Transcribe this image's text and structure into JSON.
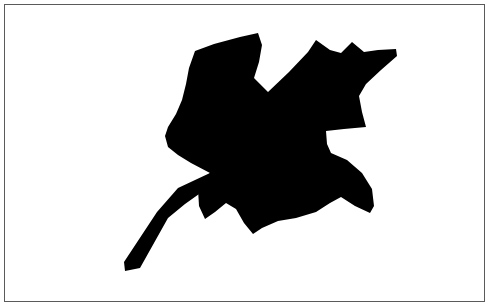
{
  "figure": {
    "canvas": {
      "width": 492,
      "height": 308,
      "background_color": "#ffffff"
    },
    "frame": {
      "name": "image-border",
      "left": 4,
      "top": 4,
      "width": 481,
      "height": 298,
      "border_width": 1,
      "border_color": "#5a5a5a",
      "fill_color": "#ffffff"
    },
    "shape": {
      "name": "maple-leaf-silhouette",
      "fill_color": "#000000",
      "description": "Solid black binary silhouette of a lobed maple-like leaf with a long slender petiole extending toward the lower left",
      "bounding_box": {
        "x": 124,
        "y": 32,
        "width": 274,
        "height": 242
      },
      "blade_points": [
        [
          195,
          51
        ],
        [
          214,
          44
        ],
        [
          240,
          37
        ],
        [
          258,
          33
        ],
        [
          262,
          45
        ],
        [
          259,
          62
        ],
        [
          254,
          78
        ],
        [
          268,
          92
        ],
        [
          289,
          72
        ],
        [
          308,
          52
        ],
        [
          316,
          40
        ],
        [
          330,
          50
        ],
        [
          341,
          53
        ],
        [
          352,
          42
        ],
        [
          364,
          52
        ],
        [
          378,
          50
        ],
        [
          396,
          49
        ],
        [
          397,
          56
        ],
        [
          381,
          70
        ],
        [
          366,
          84
        ],
        [
          359,
          96
        ],
        [
          362,
          112
        ],
        [
          366,
          127
        ],
        [
          344,
          129
        ],
        [
          326,
          131
        ],
        [
          327,
          144
        ],
        [
          331,
          153
        ],
        [
          347,
          160
        ],
        [
          362,
          173
        ],
        [
          372,
          189
        ],
        [
          374,
          206
        ],
        [
          370,
          213
        ],
        [
          355,
          206
        ],
        [
          341,
          197
        ],
        [
          330,
          203
        ],
        [
          316,
          212
        ],
        [
          296,
          218
        ],
        [
          278,
          221
        ],
        [
          262,
          228
        ],
        [
          253,
          234
        ],
        [
          244,
          223
        ],
        [
          236,
          209
        ],
        [
          226,
          203
        ],
        [
          215,
          212
        ],
        [
          205,
          219
        ],
        [
          199,
          206
        ],
        [
          198,
          189
        ],
        [
          205,
          178
        ],
        [
          210,
          173
        ],
        [
          191,
          163
        ],
        [
          178,
          155
        ],
        [
          168,
          147
        ],
        [
          165,
          136
        ],
        [
          168,
          127
        ],
        [
          176,
          114
        ],
        [
          182,
          100
        ],
        [
          186,
          84
        ],
        [
          189,
          68
        ]
      ],
      "stem_points": [
        [
          210,
          173
        ],
        [
          216,
          182
        ],
        [
          185,
          204
        ],
        [
          168,
          218
        ],
        [
          140,
          268
        ],
        [
          125,
          271
        ],
        [
          124,
          262
        ],
        [
          157,
          212
        ],
        [
          178,
          188
        ]
      ]
    }
  }
}
